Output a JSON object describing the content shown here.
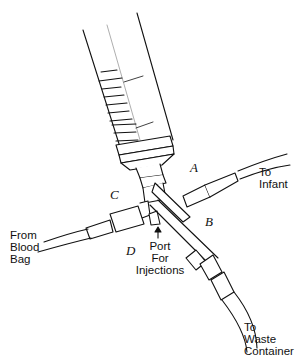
{
  "diagram": {
    "type": "syringe-stopcock-exchange-transfusion-setup",
    "labels": {
      "valve_a": "A",
      "valve_b": "B",
      "valve_c": "C",
      "valve_d": "D",
      "to_infant": [
        "To",
        "Infant"
      ],
      "from_blood_bag": [
        "From",
        "Blood",
        "Bag"
      ],
      "port": [
        "Port",
        "For",
        "Injections"
      ],
      "to_waste": [
        "To",
        "Waste",
        "Container"
      ]
    },
    "colors": {
      "ink": "#111111",
      "background": "#ffffff"
    }
  }
}
